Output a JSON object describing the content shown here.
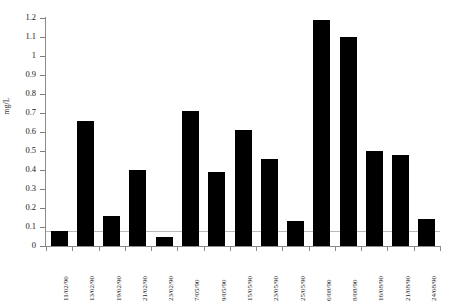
{
  "chart_data": {
    "type": "bar",
    "title": "",
    "xlabel": "",
    "ylabel": "mg/L",
    "ylim": [
      0,
      1.2
    ],
    "ytick_step": 0.1,
    "grid": false,
    "legend": "none",
    "bar_color": "#000000",
    "axis_color": "#8a8a8a",
    "reference_line": {
      "value": 0.08,
      "color": "#b9b9b9"
    },
    "ytick_labels": [
      "0",
      "0.1",
      "0.2",
      "0.3",
      "0.4",
      "0.5",
      "0.6",
      "0.7",
      "0.8",
      "0.9",
      "1",
      "1.1",
      "1.2"
    ],
    "ytick_values": [
      0,
      0.1,
      0.2,
      0.3,
      0.4,
      0.5,
      0.6,
      0.7,
      0.8,
      0.9,
      1.0,
      1.1,
      1.2
    ],
    "categories": [
      "11/02/90",
      "13/02/90",
      "19/02/90",
      "21/02/90",
      "23/02/90",
      "7/05/90",
      "9/05/90",
      "15/05/90",
      "23/05/90",
      "25/05/90",
      "6/08/90",
      "8/08/90",
      "16/08/90",
      "21/08/90",
      "24/08/90"
    ],
    "values": [
      0.08,
      0.66,
      0.16,
      0.4,
      0.05,
      0.71,
      0.39,
      0.61,
      0.46,
      0.13,
      1.19,
      1.1,
      0.5,
      0.48,
      0.14
    ]
  }
}
